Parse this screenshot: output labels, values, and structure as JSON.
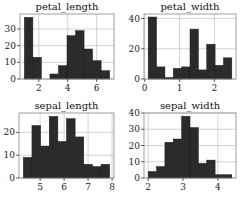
{
  "chart_data": [
    {
      "type": "bar",
      "title": "petal_length",
      "xlabel": "",
      "ylabel": "",
      "bin_edges": [
        1.0,
        1.59,
        2.18,
        2.77,
        3.36,
        3.95,
        4.54,
        5.13,
        5.72,
        6.31,
        6.9
      ],
      "values": [
        37,
        13,
        0,
        3,
        8,
        26,
        29,
        18,
        11,
        5
      ],
      "xlim": [
        0.7,
        7.2
      ],
      "ylim": [
        0,
        39
      ],
      "xticks": [
        2,
        4,
        6
      ],
      "yticks": [
        0,
        10,
        20,
        30
      ],
      "grid": true,
      "frame": {
        "x": 20,
        "y": 14,
        "w": 94,
        "h": 65
      }
    },
    {
      "type": "bar",
      "title": "petal_width",
      "xlabel": "",
      "ylabel": "",
      "bin_edges": [
        0.1,
        0.34,
        0.58,
        0.82,
        1.06,
        1.3,
        1.54,
        1.78,
        2.02,
        2.26,
        2.5
      ],
      "values": [
        41,
        8,
        1,
        7,
        8,
        33,
        6,
        23,
        9,
        14
      ],
      "xlim": [
        -0.02,
        2.62
      ],
      "ylim": [
        0,
        43
      ],
      "xticks": [
        0,
        1,
        2
      ],
      "yticks": [
        0,
        20,
        40
      ],
      "grid": true,
      "frame": {
        "x": 144,
        "y": 14,
        "w": 92,
        "h": 65
      }
    },
    {
      "type": "bar",
      "title": "sepal_length",
      "xlabel": "",
      "ylabel": "",
      "bin_edges": [
        4.3,
        4.66,
        5.02,
        5.38,
        5.74,
        6.1,
        6.46,
        6.82,
        7.18,
        7.54,
        7.9
      ],
      "values": [
        9,
        23,
        14,
        27,
        16,
        26,
        18,
        6,
        5,
        6
      ],
      "xlim": [
        4.12,
        8.08
      ],
      "ylim": [
        0,
        28.5
      ],
      "xticks": [
        5,
        6,
        7,
        8
      ],
      "yticks": [
        0,
        10,
        20
      ],
      "grid": true,
      "frame": {
        "x": 19,
        "y": 113,
        "w": 95,
        "h": 65
      }
    },
    {
      "type": "bar",
      "title": "sepal_width",
      "xlabel": "",
      "ylabel": "",
      "bin_edges": [
        2.0,
        2.24,
        2.48,
        2.72,
        2.96,
        3.2,
        3.44,
        3.68,
        3.92,
        4.16,
        4.4
      ],
      "values": [
        4,
        7,
        22,
        24,
        38,
        31,
        9,
        11,
        2,
        2
      ],
      "xlim": [
        1.88,
        4.52
      ],
      "ylim": [
        0,
        40
      ],
      "xticks": [
        2,
        3,
        4
      ],
      "yticks": [
        0,
        10,
        20,
        30,
        40
      ],
      "grid": true,
      "frame": {
        "x": 144,
        "y": 113,
        "w": 92,
        "h": 65
      }
    }
  ],
  "style": {
    "bar_color": "#2b2b2b",
    "bar_edge": "#1a1a1a",
    "grid_color": "#c8c8c8",
    "frame_color": "#888888",
    "tick_color": "#333333"
  }
}
